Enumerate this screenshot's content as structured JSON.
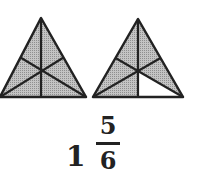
{
  "figure": {
    "triangles": [
      {
        "parts": 6,
        "shaded": 6
      },
      {
        "parts": 6,
        "shaded": 5
      }
    ],
    "colors": {
      "shade": "#b3b3b3",
      "stroke": "#222222",
      "unshaded": "#ffffff"
    }
  },
  "mixed_number": {
    "whole": "1",
    "numerator": "5",
    "denominator": "6"
  }
}
